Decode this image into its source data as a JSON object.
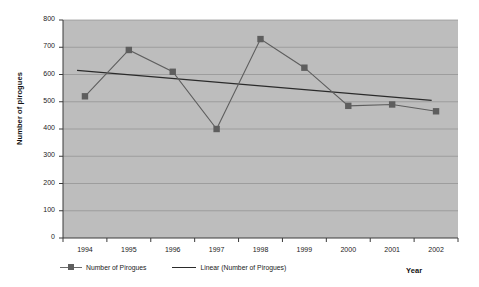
{
  "chart_data": {
    "type": "line",
    "title": "",
    "xlabel": "Year",
    "ylabel": "Number of pirogues",
    "categories": [
      "1994",
      "1995",
      "1996",
      "1997",
      "1998",
      "1999",
      "2000",
      "2001",
      "2002"
    ],
    "ylim": [
      0,
      800
    ],
    "ytick_step": 100,
    "yticks": [
      "800",
      "700",
      "600",
      "500",
      "400",
      "300",
      "200",
      "100",
      "0"
    ],
    "grid": "horizontal",
    "legend_position": "bottom-left",
    "series": [
      {
        "name": "Number of Pirogues",
        "kind": "line-marker",
        "color": "#5e5e5e",
        "values": [
          520,
          690,
          610,
          400,
          730,
          625,
          485,
          490,
          465
        ]
      },
      {
        "name": "Linear (Number of Pirogues)",
        "kind": "trendline",
        "color": "#2b2b2b",
        "endpoints": [
          615,
          505
        ]
      }
    ],
    "plot_background": "#bdbdbd",
    "page_background": "#ffffff"
  },
  "legend": {
    "items": [
      {
        "label": "Number of Pirogues"
      },
      {
        "label": "Linear (Number of Pirogues)"
      }
    ]
  },
  "axes": {
    "y_title": "Number of pirogues",
    "x_title": "Year"
  }
}
